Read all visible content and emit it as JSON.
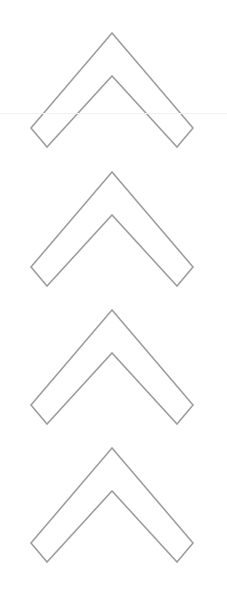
{
  "canvas": {
    "width": 227,
    "height": 605,
    "background_color": "#ffffff"
  },
  "style": {
    "stroke_color": "#9e9e9e",
    "stroke_width": 1.6,
    "fill": "none",
    "rule_color": "#f1f1f1"
  },
  "divider": {
    "name": "faint-horizontal-rule",
    "y": 113,
    "color": "#f1f1f1",
    "label": "faint horizontal divider line"
  },
  "glyph": {
    "name": "chevron-up",
    "description": "outlined upward chevron / caret arrow",
    "repeat_count": 4
  },
  "chevrons": [
    {
      "index": 1,
      "label": "chevron-up-1",
      "top": 28,
      "left": 26,
      "width": 172,
      "height": 124,
      "apex_x": 112,
      "apex_y": 33,
      "outer_bottom_left": [
        31,
        128
      ],
      "outer_bottom_right": [
        193,
        128
      ],
      "inner_apex_y": 76,
      "v_tip_y": 147
    },
    {
      "index": 2,
      "label": "chevron-up-2",
      "top": 167,
      "left": 26,
      "width": 172,
      "height": 124,
      "apex_x": 112,
      "apex_y": 172,
      "outer_bottom_left": [
        31,
        267
      ],
      "outer_bottom_right": [
        193,
        267
      ],
      "inner_apex_y": 215,
      "v_tip_y": 286
    },
    {
      "index": 3,
      "label": "chevron-up-3",
      "top": 305,
      "left": 26,
      "width": 172,
      "height": 124,
      "apex_x": 112,
      "apex_y": 310,
      "outer_bottom_left": [
        31,
        405
      ],
      "outer_bottom_right": [
        193,
        405
      ],
      "inner_apex_y": 353,
      "v_tip_y": 424
    },
    {
      "index": 4,
      "label": "chevron-up-4",
      "top": 443,
      "left": 26,
      "width": 172,
      "height": 124,
      "apex_x": 112,
      "apex_y": 448,
      "outer_bottom_left": [
        31,
        543
      ],
      "outer_bottom_right": [
        193,
        543
      ],
      "inner_apex_y": 491,
      "v_tip_y": 562
    }
  ]
}
